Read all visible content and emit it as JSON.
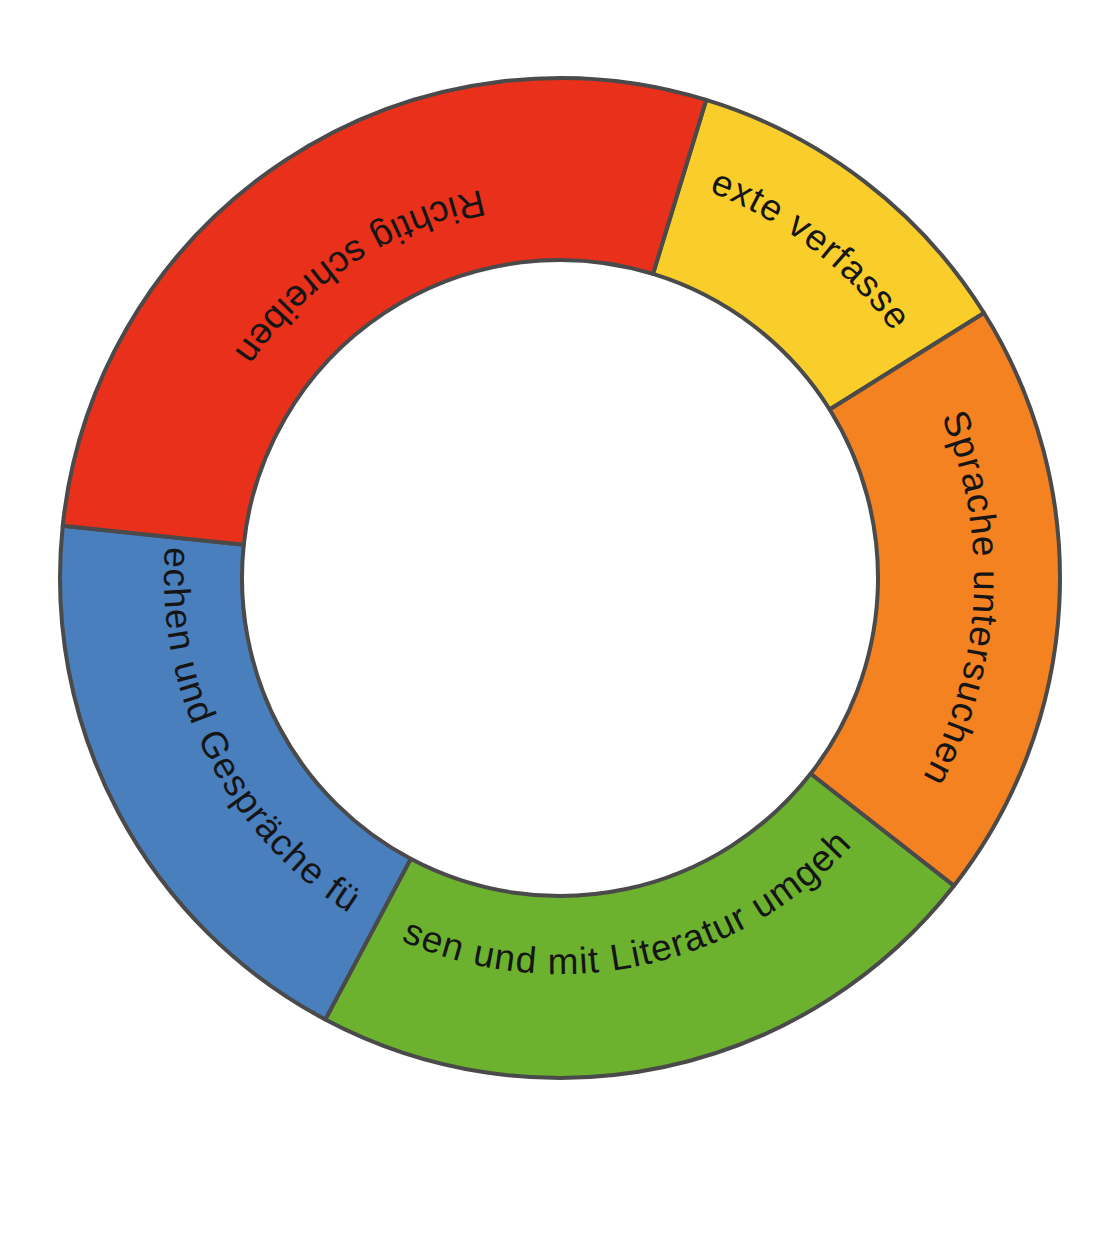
{
  "figure": {
    "kind": "donut-diagram",
    "background_color": "#ffffff",
    "outline_color": "#4a4a4a",
    "center_fill": "#ffffff"
  },
  "chart_data": {
    "type": "pie",
    "title": "",
    "subtitle": "",
    "xlabel": "",
    "ylabel": "",
    "legend_position": "none",
    "grid": false,
    "donut": true,
    "inner_radius_ratio": 0.635,
    "start_angle_deg": -73,
    "categories": [
      "Texte verfassen",
      "Sprache untersuchen",
      "Lesen und mit Literatur umgehen",
      "Sprechen und Gespräche führen",
      "Richtig schreiben"
    ],
    "values": [
      41,
      70,
      80,
      68,
      101
    ],
    "colors": [
      "#F9CE2B",
      "#F58220",
      "#6CB22E",
      "#4A7FBE",
      "#E8301A"
    ],
    "segments": [
      {
        "label": "Texte verfassen",
        "color": "#F9CE2B",
        "start_angle_deg": -73,
        "end_angle_deg": -32,
        "sweep_deg": 41,
        "label_orientation": "along-arc-outward"
      },
      {
        "label": "Sprache untersuchen",
        "color": "#F58220",
        "start_angle_deg": -32,
        "end_angle_deg": 38,
        "sweep_deg": 70,
        "label_orientation": "along-arc-outward"
      },
      {
        "label": "Lesen und mit Literatur umgehen",
        "color": "#6CB22E",
        "start_angle_deg": 38,
        "end_angle_deg": 118,
        "sweep_deg": 80,
        "label_orientation": "along-arc-inward"
      },
      {
        "label": "Sprechen und Gespräche führen",
        "color": "#4A7FBE",
        "start_angle_deg": 118,
        "end_angle_deg": 186,
        "sweep_deg": 68,
        "label_orientation": "along-arc-inward"
      },
      {
        "label": "Richtig schreiben",
        "color": "#E8301A",
        "start_angle_deg": 186,
        "end_angle_deg": 287,
        "sweep_deg": 101,
        "label_orientation": "along-arc-inward"
      }
    ]
  },
  "geometry": {
    "center_x": 560,
    "center_y": 578,
    "outer_radius": 500,
    "inner_radius": 318,
    "label_radius": 408
  }
}
